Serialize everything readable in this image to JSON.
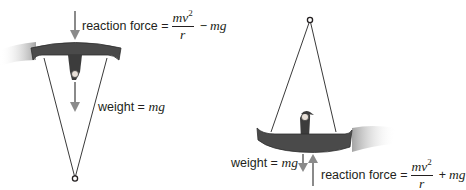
{
  "diagram": {
    "colors": {
      "boat": "#4a4a4a",
      "boat_edge": "#2e2e2e",
      "arrow": "#8a8a8a",
      "rope": "#3a3a3a",
      "text": "#231f20"
    },
    "left_panel": {
      "position": "top of swing (inverted)",
      "reaction_label": {
        "prefix": "reaction force =",
        "numerator": "mv",
        "exponent": "2",
        "denominator": "r",
        "operator": "−",
        "tail": "mg"
      },
      "weight_label": {
        "prefix": "weight =",
        "value": "mg"
      }
    },
    "right_panel": {
      "position": "bottom of swing",
      "reaction_label": {
        "prefix": "reaction force =",
        "numerator": "mv",
        "exponent": "2",
        "denominator": "r",
        "operator": "+",
        "tail": "mg"
      },
      "weight_label": {
        "prefix": "weight =",
        "value": "mg"
      }
    }
  }
}
